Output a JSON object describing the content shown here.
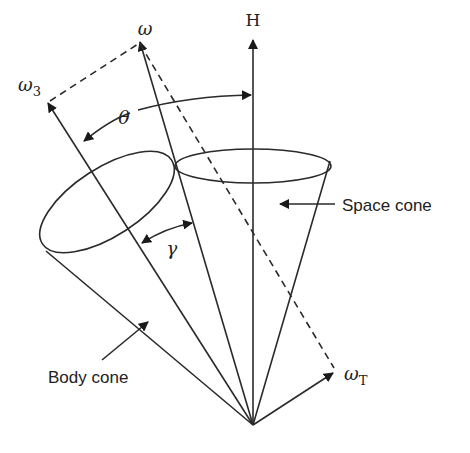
{
  "figure": {
    "vectors": {
      "angular_momentum": {
        "label": "H"
      },
      "angular_velocity": {
        "label": "ω"
      },
      "body_axis": {
        "label": "ω",
        "subscript": "3"
      },
      "transverse_velocity": {
        "label": "ω",
        "subscript": "T"
      }
    },
    "angles": {
      "nutation": {
        "label": "θ"
      },
      "cone_half_angle": {
        "label": "γ"
      }
    },
    "annotations": {
      "space_cone": "Space cone",
      "body_cone": "Body cone"
    },
    "colors": {
      "stroke": "#2a2a2a",
      "background": "#ffffff"
    }
  }
}
